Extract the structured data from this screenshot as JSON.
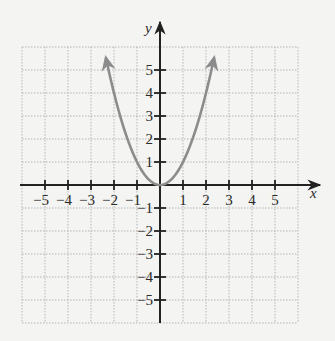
{
  "chart_data": {
    "type": "line",
    "title": "",
    "function": "y = x^2",
    "xlabel": "x",
    "ylabel": "y",
    "xlim": [
      -6,
      6
    ],
    "ylim": [
      -6,
      6
    ],
    "grid": true,
    "grid_style": "dotted",
    "x_ticks": [
      -5,
      -4,
      -3,
      -2,
      -1,
      1,
      2,
      3,
      4,
      5
    ],
    "y_ticks": [
      -5,
      -4,
      -3,
      -2,
      -1,
      1,
      2,
      3,
      4,
      5
    ],
    "x_tick_labels": [
      "−5",
      "−4",
      "−3",
      "−2",
      "−1",
      "1",
      "2",
      "3",
      "4",
      "5"
    ],
    "y_tick_labels": [
      "−5",
      "−4",
      "−3",
      "−2",
      "−1",
      "1",
      "2",
      "3",
      "4",
      "5"
    ],
    "series": [
      {
        "name": "parabola",
        "color": "#8c8c8c",
        "x": [
          -2.45,
          -2,
          -1.5,
          -1,
          -0.5,
          0,
          0.5,
          1,
          1.5,
          2,
          2.45
        ],
        "y": [
          6.0,
          4,
          2.25,
          1,
          0.25,
          0,
          0.25,
          1,
          2.25,
          4,
          6.0
        ],
        "arrows_at_ends": true
      }
    ],
    "legend": null
  },
  "colors": {
    "background": "#f4f4f2",
    "axis": "#222222",
    "grid": "#b5b5b5",
    "curve": "#8c8c8c"
  }
}
